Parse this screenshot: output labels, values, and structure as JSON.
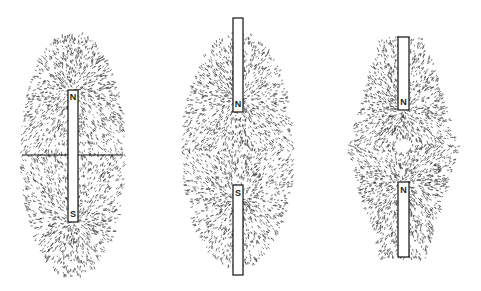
{
  "figures": [
    {
      "id": "single-bar-magnet",
      "magnets": [
        {
          "x": 68,
          "y": 90,
          "w": 10,
          "h": 132,
          "top_label": "N",
          "bottom_label": "S",
          "broken_top": false,
          "broken_bottom": false
        }
      ],
      "field": {
        "cx": 73,
        "cy": 155,
        "rx": 52,
        "ry": 122,
        "poles": [
          [
            73,
            90
          ],
          [
            73,
            222
          ]
        ],
        "shape": "oval"
      },
      "neutral_line": {
        "x1": 22,
        "x2": 123,
        "y": 155
      }
    },
    {
      "id": "opposite-poles-attract",
      "magnets": [
        {
          "x": 233,
          "y": 18,
          "w": 10,
          "h": 94,
          "label": "N",
          "label_pos": "bottom",
          "broken_top": true
        },
        {
          "x": 233,
          "y": 185,
          "w": 10,
          "h": 90,
          "label": "S",
          "label_pos": "top",
          "broken_bottom": true
        }
      ],
      "field": {
        "cx": 238,
        "cy": 150,
        "rx": 55,
        "ry": 118,
        "poles": [
          [
            238,
            100
          ],
          [
            238,
            200
          ]
        ],
        "shape": "oval"
      }
    },
    {
      "id": "like-poles-repel",
      "magnets": [
        {
          "x": 398,
          "y": 37,
          "w": 11,
          "h": 73,
          "label": "N",
          "label_pos": "bottom",
          "broken_top": true
        },
        {
          "x": 398,
          "y": 182,
          "w": 11,
          "h": 75,
          "label": "N",
          "label_pos": "top",
          "broken_bottom": true
        }
      ],
      "field": {
        "cx": 403,
        "cy": 148,
        "rx": 55,
        "ry": 110,
        "poles": [
          [
            403,
            110
          ],
          [
            403,
            182
          ]
        ],
        "shape": "diamond"
      },
      "neutral_point": {
        "x": 403,
        "y": 146
      }
    }
  ],
  "colors": {
    "filings": "#1a1a1a",
    "magnet_fill": "#ffffff",
    "magnet_stroke": "#111111",
    "background": "#ffffff"
  }
}
